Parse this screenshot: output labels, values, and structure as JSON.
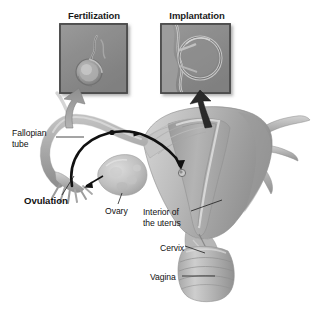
{
  "figure": {
    "background_color": "#ffffff",
    "width": 314,
    "height": 310
  },
  "insets": [
    {
      "id": "fertilization",
      "title": "Fertilization",
      "caption_position": "above",
      "image_description": "micrograph of sperm at egg cell"
    },
    {
      "id": "implantation",
      "title": "Implantation",
      "caption_position": "above",
      "image_description": "micrograph of blastocyst implanting in uterine wall"
    }
  ],
  "labels": {
    "fallopian_tube_line1": "Fallopian",
    "fallopian_tube_line2": "tube",
    "ovulation": "Ovulation",
    "ovary": "Ovary",
    "interior_line1": "Interior of",
    "interior_line2": "the uterus",
    "cervix": "Cervix",
    "vagina": "Vagina"
  },
  "colors": {
    "text": "#111111",
    "inset_frame": "#4e4e4e",
    "inset_fill": "#8d8d8d",
    "organ_light": "#c9c9c9",
    "organ_mid": "#a9a9a9",
    "organ_dark": "#8a8a8a",
    "pathway": "#111111",
    "arrow_gray": "#9a9a9a",
    "leader_line": "#222222"
  }
}
